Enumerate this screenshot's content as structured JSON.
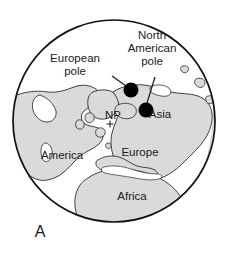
{
  "figure": {
    "panel_label": "A",
    "projection": "polar-orthographic-north",
    "colors": {
      "land_fill": "#d9d9d9",
      "ocean_fill": "#ffffff",
      "outline": "#1a1a1a",
      "pole_marker": "#000000",
      "background": "#ffffff",
      "text": "#1a1a1a"
    },
    "globe": {
      "center_x": 114,
      "center_y": 121,
      "radius": 101
    }
  },
  "continent_labels": [
    {
      "text": "America",
      "x": 62,
      "y": 159
    },
    {
      "text": "Asia",
      "x": 158,
      "y": 117
    },
    {
      "text": "Europe",
      "x": 140,
      "y": 155
    },
    {
      "text": "Africa",
      "x": 130,
      "y": 199
    }
  ],
  "pole_markers": [
    {
      "name": "European pole",
      "label_lines": [
        "European",
        "pole"
      ],
      "label_x": 75,
      "label_y": 62,
      "dot_x": 131,
      "dot_y": 90,
      "dot_radius": 7.5,
      "leader_from_x": 112,
      "leader_from_y": 76,
      "leader_to_x": 126,
      "leader_to_y": 86
    },
    {
      "name": "North American pole",
      "label_lines": [
        "North",
        "American",
        "pole"
      ],
      "label_x": 140,
      "label_y": 50,
      "dot_x": 146,
      "dot_y": 110,
      "dot_radius": 7.5,
      "leader_from_x": 155,
      "leader_from_y": 77,
      "leader_to_x": 147,
      "leader_to_y": 103
    }
  ],
  "geographic_pole": {
    "label": "NP",
    "label_x": 113,
    "label_y": 118,
    "cross_x": 110,
    "cross_y": 124,
    "cross_size": 3.5
  }
}
